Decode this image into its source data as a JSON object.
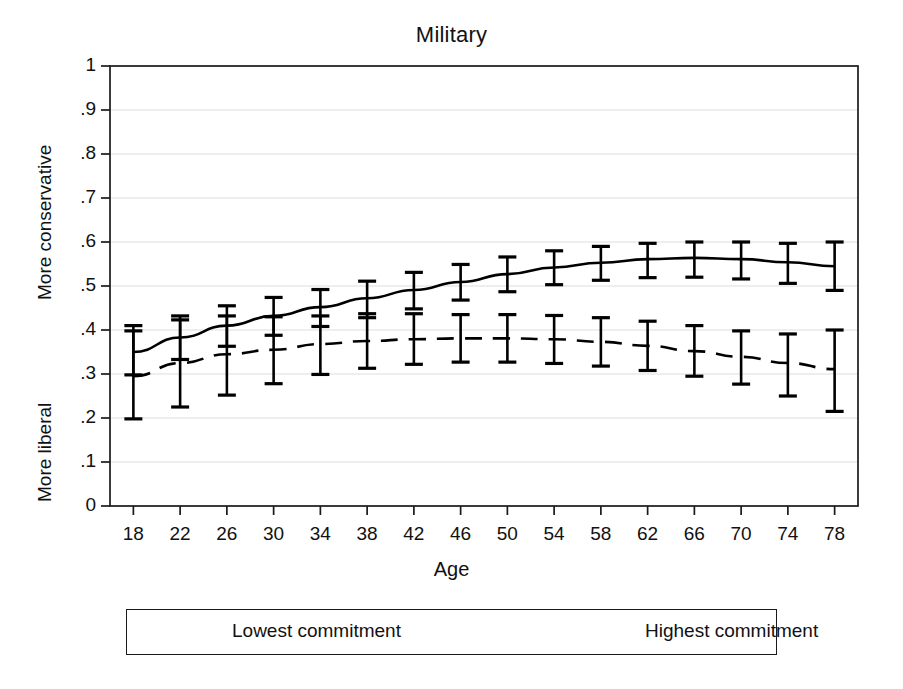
{
  "chart_data": {
    "type": "line",
    "title": "Military",
    "xlabel": "Age",
    "ylabel_top": "More conservative",
    "ylabel_bottom": "More liberal",
    "x": [
      18,
      22,
      26,
      30,
      34,
      38,
      42,
      46,
      50,
      54,
      58,
      62,
      66,
      70,
      74,
      78
    ],
    "xlim": [
      16,
      80
    ],
    "ylim": [
      0,
      1
    ],
    "xticks": [
      18,
      22,
      26,
      30,
      34,
      38,
      42,
      46,
      50,
      54,
      58,
      62,
      66,
      70,
      74,
      78
    ],
    "xtick_labels": [
      "18",
      "22",
      "26",
      "30",
      "34",
      "38",
      "42",
      "46",
      "50",
      "54",
      "58",
      "62",
      "66",
      "70",
      "74",
      "78"
    ],
    "yticks": [
      0,
      0.1,
      0.2,
      0.3,
      0.4,
      0.5,
      0.6,
      0.7,
      0.8,
      0.9,
      1
    ],
    "ytick_labels": [
      "0",
      ".1",
      ".2",
      ".3",
      ".4",
      ".5",
      ".6",
      ".7",
      ".8",
      ".9",
      "1"
    ],
    "grid": true,
    "grid_axis": "y",
    "legend_position": "below-plot",
    "series": [
      {
        "name": "Lowest commitment",
        "style": "dashed",
        "color": "#000000",
        "values": [
          0.295,
          0.325,
          0.345,
          0.355,
          0.368,
          0.375,
          0.379,
          0.381,
          0.381,
          0.379,
          0.373,
          0.364,
          0.352,
          0.339,
          0.325,
          0.311
        ],
        "ci_lower": [
          0.198,
          0.225,
          0.252,
          0.278,
          0.299,
          0.313,
          0.322,
          0.327,
          0.327,
          0.324,
          0.318,
          0.308,
          0.295,
          0.277,
          0.25,
          0.215
        ],
        "ci_upper": [
          0.398,
          0.423,
          0.432,
          0.43,
          0.432,
          0.437,
          0.437,
          0.435,
          0.435,
          0.433,
          0.428,
          0.42,
          0.41,
          0.398,
          0.391,
          0.4
        ]
      },
      {
        "name": "Highest commitment",
        "style": "solid",
        "color": "#000000",
        "values": [
          0.35,
          0.383,
          0.41,
          0.432,
          0.452,
          0.472,
          0.491,
          0.509,
          0.527,
          0.542,
          0.553,
          0.561,
          0.564,
          0.561,
          0.554,
          0.545
        ],
        "ci_lower": [
          0.298,
          0.333,
          0.363,
          0.388,
          0.408,
          0.428,
          0.448,
          0.468,
          0.487,
          0.503,
          0.513,
          0.519,
          0.52,
          0.516,
          0.506,
          0.49
        ],
        "ci_upper": [
          0.41,
          0.432,
          0.455,
          0.474,
          0.492,
          0.511,
          0.531,
          0.549,
          0.566,
          0.58,
          0.59,
          0.597,
          0.6,
          0.6,
          0.597,
          0.6
        ]
      }
    ]
  },
  "legend": {
    "items": [
      {
        "label": "Lowest commitment",
        "style": "dashed"
      },
      {
        "label": "Highest commitment",
        "style": "solid"
      }
    ]
  }
}
